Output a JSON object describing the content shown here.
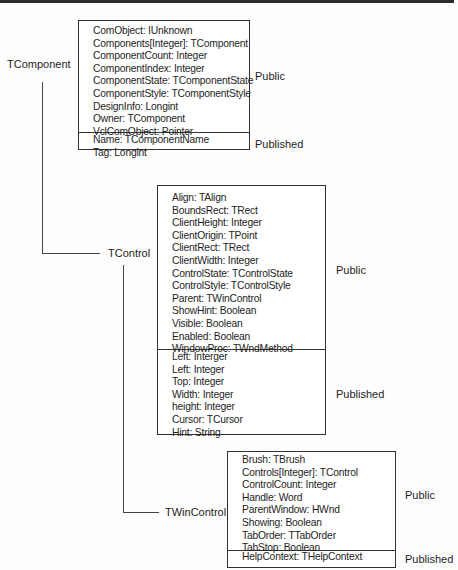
{
  "classes": [
    {
      "name": "TComponent",
      "public_label": "Public",
      "published_label": "Published",
      "public": [
        "ComObject: IUnknown",
        "Components[Integer]: TComponent",
        "ComponentCount: Integer",
        "ComponentIndex: Integer",
        "ComponentState: TComponentState",
        "ComponentStyle: TComponentStyle",
        "DesignInfo: Longint",
        "Owner: TComponent",
        "VclComObject: Pointer"
      ],
      "published": [
        "Name: TComponentName",
        "Tag: Longint"
      ]
    },
    {
      "name": "TControl",
      "public_label": "Public",
      "published_label": "Published",
      "public": [
        "Align: TAlign",
        "BoundsRect: TRect",
        "ClientHeight: Integer",
        "ClientOrigin: TPoint",
        "ClientRect: TRect",
        "ClientWidth: Integer",
        "ControlState: TControlState",
        "ControlStyle: TControlStyle",
        "Parent: TWinControl",
        "ShowHint: Boolean",
        "Visible: Boolean",
        "Enabled: Boolean",
        "WindowProc: TWndMethod"
      ],
      "published": [
        "Left: Interger",
        "Left: Integer",
        "Top: Integer",
        "Width: Integer",
        "height: Integer",
        "Cursor: TCursor",
        "Hint: String"
      ]
    },
    {
      "name": "TWinControl",
      "public_label": "Public",
      "published_label": "Published",
      "public": [
        "Brush: TBrush",
        "Controls[Integer]: TControl",
        "ControlCount: Integer",
        "Handle: Word",
        "ParentWindow: HWnd",
        "Showing: Boolean",
        "TabOrder: TTabOrder",
        "TabStop: Boolean"
      ],
      "published": [
        "HelpContext: THelpContext"
      ]
    }
  ]
}
